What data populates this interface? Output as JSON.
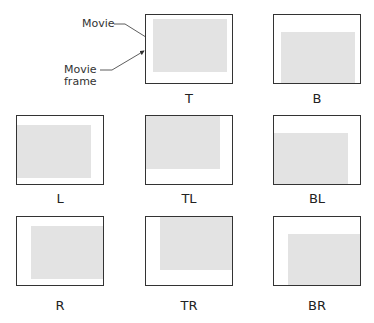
{
  "callouts": {
    "movie": "Movie",
    "frame_line1": "Movie",
    "frame_line2": "frame"
  },
  "panels": [
    {
      "id": "T",
      "label": "T"
    },
    {
      "id": "B",
      "label": "B"
    },
    {
      "id": "L",
      "label": "L"
    },
    {
      "id": "TL",
      "label": "TL"
    },
    {
      "id": "BL",
      "label": "BL"
    },
    {
      "id": "R",
      "label": "R"
    },
    {
      "id": "TR",
      "label": "TR"
    },
    {
      "id": "BR",
      "label": "BR"
    }
  ]
}
